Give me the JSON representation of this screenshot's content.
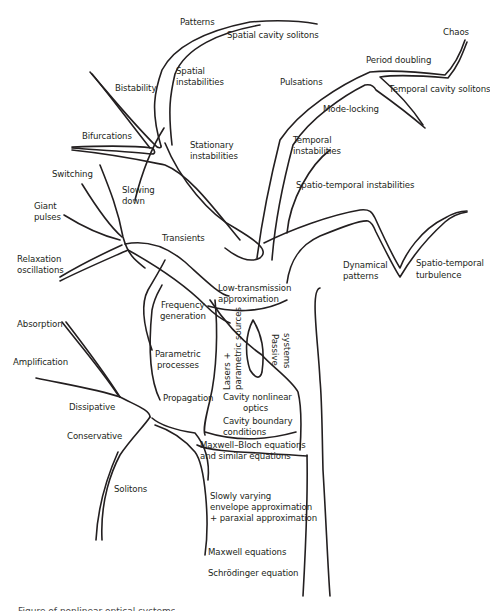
{
  "figure": {
    "caption_partial": "Figure of nonlinear optical systems",
    "stroke_color": "#231f20",
    "background": "#ffffff"
  },
  "labels": {
    "patterns": "Patterns",
    "spatial_cavity_solitons": "Spatial cavity solitons",
    "spatial_instabilities_1": "Spatial",
    "spatial_instabilities_2": "instabilities",
    "bistability": "Bistability",
    "bifurcations": "Bifurcations",
    "stationary_instabilities_1": "Stationary",
    "stationary_instabilities_2": "instabilities",
    "switching": "Switching",
    "slowing_down_1": "Slowing",
    "slowing_down_2": "down",
    "giant_pulses_1": "Giant",
    "giant_pulses_2": "pulses",
    "transients": "Transients",
    "relaxation_oscillations_1": "Relaxation",
    "relaxation_oscillations_2": "oscillations",
    "chaos": "Chaos",
    "period_doubling": "Period doubling",
    "pulsations": "Pulsations",
    "temporal_cavity_solitons": "Temporal cavity solitons",
    "mode_locking": "Mode-locking",
    "temporal_instabilities_1": "Temporal",
    "temporal_instabilities_2": "instabilities",
    "spatio_temporal_instabilities": "Spatio-temporal instabilities",
    "dynamical_patterns_1": "Dynamical",
    "dynamical_patterns_2": "patterns",
    "spatio_temporal_turbulence_1": "Spatio-temporal",
    "spatio_temporal_turbulence_2": "turbulence",
    "low_transmission_1": "Low-transmission",
    "low_transmission_2": "approximation",
    "frequency_generation_1": "Frequency",
    "frequency_generation_2": "generation",
    "parametric_processes_1": "Parametric",
    "parametric_processes_2": "processes",
    "propagation": "Propagation",
    "lasers_1": "Lasers +",
    "lasers_2": "parametric sources",
    "passive_systems_1": "Passive",
    "passive_systems_2": "systems",
    "cavity_nonlinear_optics_1": "Cavity nonlinear",
    "cavity_nonlinear_optics_2": "optics",
    "cavity_boundary_1": "Cavity boundary",
    "cavity_boundary_2": "conditions",
    "absorption": "Absorption",
    "amplification": "Amplification",
    "dissipative": "Dissipative",
    "conservative": "Conservative",
    "maxwell_bloch_1": "Maxwell–Bloch equations",
    "maxwell_bloch_2": "and similar equations",
    "solitons": "Solitons",
    "svea_1": "Slowly varying",
    "svea_2": "envelope approximation",
    "svea_3": "+ paraxial approximation",
    "maxwell_equations": "Maxwell equations",
    "schrodinger_equation": "Schrödinger equation"
  }
}
